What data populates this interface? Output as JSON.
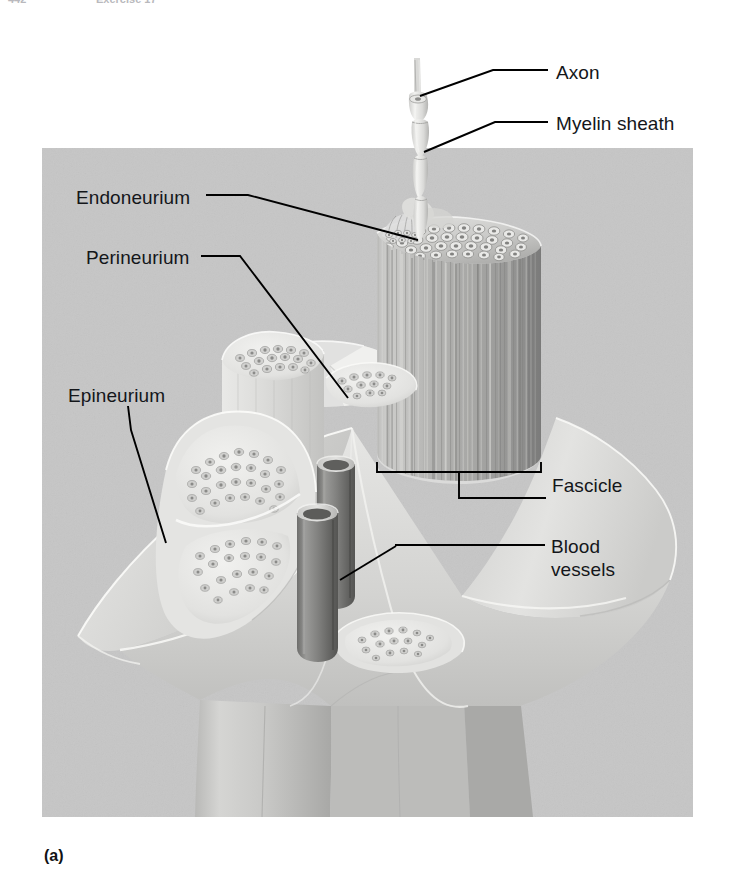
{
  "header": {
    "page_number": "442",
    "exercise_label": "Exercise 17"
  },
  "figure": {
    "caption": "(a)",
    "panel_background": "#c6c6c6",
    "line_color": "#000000",
    "text_color": "#14161a",
    "labels": [
      {
        "id": "axon",
        "text": "Axon"
      },
      {
        "id": "myelin",
        "text": "Myelin sheath"
      },
      {
        "id": "endoneurium",
        "text": "Endoneurium"
      },
      {
        "id": "perineurium",
        "text": "Perineurium"
      },
      {
        "id": "epineurium",
        "text": "Epineurium"
      },
      {
        "id": "fascicle",
        "text": "Fascicle"
      },
      {
        "id": "blood",
        "text": "Blood vessels"
      }
    ],
    "structures": [
      "axon",
      "myelin sheath",
      "endoneurium",
      "perineurium",
      "epineurium",
      "fascicle",
      "blood vessels"
    ]
  }
}
